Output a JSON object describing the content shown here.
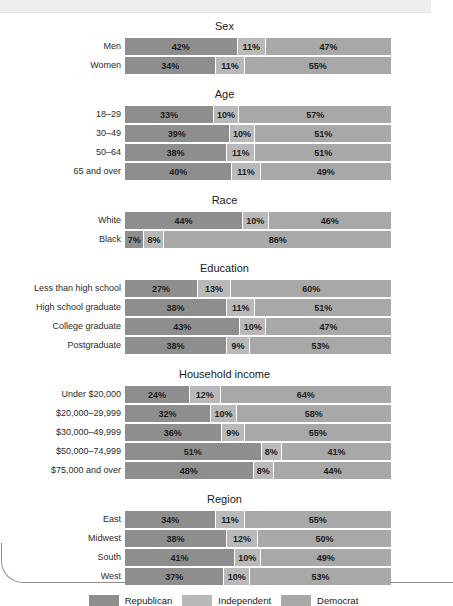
{
  "colors": {
    "republican": "#8e8e8e",
    "independent": "#b9b9b9",
    "democrat": "#a8a8a8",
    "background": "#ffffff",
    "text": "#1a1a1a"
  },
  "legend": {
    "items": [
      {
        "key": "republican",
        "label": "Republican"
      },
      {
        "key": "independent",
        "label": "Independent"
      },
      {
        "key": "democrat",
        "label": "Democrat"
      }
    ]
  },
  "chart_data": {
    "type": "bar",
    "orientation": "horizontal",
    "stacked": true,
    "normalized": true,
    "title": "",
    "xlabel": "",
    "ylabel": "",
    "xlim": [
      0,
      100
    ],
    "grid": false,
    "legend_position": "bottom",
    "series": [
      {
        "name": "Republican",
        "color": "#8e8e8e"
      },
      {
        "name": "Independent",
        "color": "#b9b9b9"
      },
      {
        "name": "Democrat",
        "color": "#a8a8a8"
      }
    ],
    "groups": [
      {
        "title": "Sex",
        "rows": [
          {
            "label": "Men",
            "values": [
              42,
              11,
              47
            ],
            "labels": [
              "42%",
              "11%",
              "47%"
            ]
          },
          {
            "label": "Women",
            "values": [
              34,
              11,
              55
            ],
            "labels": [
              "34%",
              "11%",
              "55%"
            ]
          }
        ]
      },
      {
        "title": "Age",
        "rows": [
          {
            "label": "18–29",
            "values": [
              33,
              10,
              57
            ],
            "labels": [
              "33%",
              "10%",
              "57%"
            ]
          },
          {
            "label": "30–49",
            "values": [
              39,
              10,
              51
            ],
            "labels": [
              "39%",
              "10%",
              "51%"
            ]
          },
          {
            "label": "50–64",
            "values": [
              38,
              11,
              51
            ],
            "labels": [
              "38%",
              "11%",
              "51%"
            ]
          },
          {
            "label": "65 and over",
            "values": [
              40,
              11,
              49
            ],
            "labels": [
              "40%",
              "11%",
              "49%"
            ]
          }
        ]
      },
      {
        "title": "Race",
        "rows": [
          {
            "label": "White",
            "values": [
              44,
              10,
              46
            ],
            "labels": [
              "44%",
              "10%",
              "46%"
            ]
          },
          {
            "label": "Black",
            "values": [
              7,
              8,
              86
            ],
            "labels": [
              "7%",
              "8%",
              "86%"
            ]
          }
        ]
      },
      {
        "title": "Education",
        "rows": [
          {
            "label": "Less than high school",
            "values": [
              27,
              13,
              60
            ],
            "labels": [
              "27%",
              "13%",
              "60%"
            ]
          },
          {
            "label": "High school graduate",
            "values": [
              38,
              11,
              51
            ],
            "labels": [
              "38%",
              "11%",
              "51%"
            ]
          },
          {
            "label": "College graduate",
            "values": [
              43,
              10,
              47
            ],
            "labels": [
              "43%",
              "10%",
              "47%"
            ]
          },
          {
            "label": "Postgraduate",
            "values": [
              38,
              9,
              53
            ],
            "labels": [
              "38%",
              "9%",
              "53%"
            ]
          }
        ]
      },
      {
        "title": "Household income",
        "rows": [
          {
            "label": "Under $20,000",
            "values": [
              24,
              12,
              64
            ],
            "labels": [
              "24%",
              "12%",
              "64%"
            ]
          },
          {
            "label": "$20,000–29,999",
            "values": [
              32,
              10,
              58
            ],
            "labels": [
              "32%",
              "10%",
              "58%"
            ]
          },
          {
            "label": "$30,000–49,999",
            "values": [
              36,
              9,
              55
            ],
            "labels": [
              "36%",
              "9%",
              "55%"
            ]
          },
          {
            "label": "$50,000–74,999",
            "values": [
              51,
              8,
              41
            ],
            "labels": [
              "51%",
              "8%",
              "41%"
            ]
          },
          {
            "label": "$75,000 and over",
            "values": [
              48,
              8,
              44
            ],
            "labels": [
              "48%",
              "8%",
              "44%"
            ]
          }
        ]
      },
      {
        "title": "Region",
        "rows": [
          {
            "label": "East",
            "values": [
              34,
              11,
              55
            ],
            "labels": [
              "34%",
              "11%",
              "55%"
            ]
          },
          {
            "label": "Midwest",
            "values": [
              38,
              12,
              50
            ],
            "labels": [
              "38%",
              "12%",
              "50%"
            ]
          },
          {
            "label": "South",
            "values": [
              41,
              10,
              49
            ],
            "labels": [
              "41%",
              "10%",
              "49%"
            ]
          },
          {
            "label": "West",
            "values": [
              37,
              10,
              53
            ],
            "labels": [
              "37%",
              "10%",
              "53%"
            ]
          }
        ]
      }
    ]
  }
}
